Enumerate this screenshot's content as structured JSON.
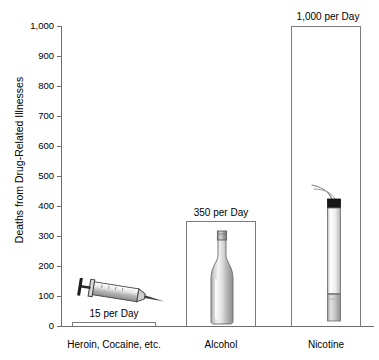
{
  "chart_data": {
    "type": "bar",
    "title": "",
    "xlabel": "",
    "ylabel": "Deaths from Drug-Related Illnesses",
    "ylim": [
      0,
      1000
    ],
    "ytick_labels": [
      "1,000",
      "900",
      "800",
      "700",
      "600",
      "500",
      "400",
      "300",
      "200",
      "100",
      "0"
    ],
    "ytick_values": [
      1000,
      900,
      800,
      700,
      600,
      500,
      400,
      300,
      200,
      100,
      0
    ],
    "grid": false,
    "legend": false,
    "categories": [
      "Heroin, Cocaine, etc.",
      "Alcohol",
      "Nicotine"
    ],
    "values": [
      15,
      350,
      1000
    ],
    "value_labels": [
      "15 per Day",
      "350 per Day",
      "1,000 per Day"
    ],
    "bar_icons": [
      "syringe-icon",
      "bottle-icon",
      "cigarette-icon"
    ],
    "colors": {
      "bar_outline": "#7a7a7a",
      "axis": "#6d6d6d",
      "text": "#000000",
      "icon_light": "#f2f2f2",
      "icon_mid": "#b9b9b9",
      "icon_dark": "#6e6e6e",
      "cigarette_tip": "#1a1a1a",
      "background": "#ffffff"
    }
  }
}
